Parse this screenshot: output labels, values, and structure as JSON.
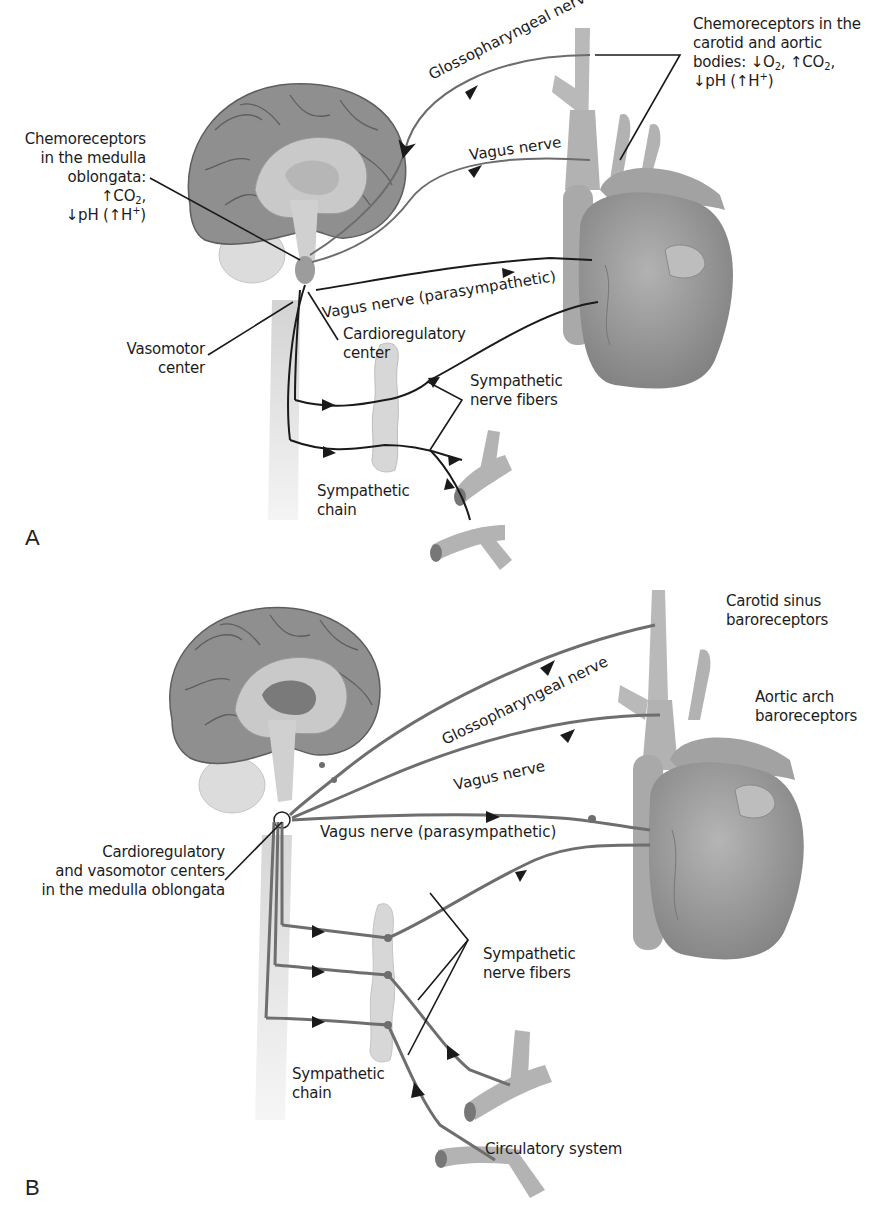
{
  "panelA": {
    "letter": "A",
    "labels": {
      "medulla_chemo_line1": "Chemoreceptors",
      "medulla_chemo_line2": "in the medulla",
      "medulla_chemo_line3": "oblongata:",
      "medulla_chemo_co2": "↑CO",
      "medulla_chemo_co2_sub": "2",
      "medulla_chemo_co2_tail": ",",
      "medulla_chemo_ph": "↓pH (↑H",
      "medulla_chemo_ph_sup": "+",
      "medulla_chemo_ph_tail": ")",
      "carotid_line1": "Chemoreceptors in the",
      "carotid_line2": "carotid and aortic",
      "carotid_line3a": "bodies: ↓O",
      "carotid_line3_sub1": "2",
      "carotid_line3b": ", ↑CO",
      "carotid_line3_sub2": "2",
      "carotid_line3c": ",",
      "carotid_line4a": "↓pH (↑H",
      "carotid_line4_sup": "+",
      "carotid_line4b": ")",
      "glossopharyngeal": "Glossopharyngeal nerve",
      "vagus": "Vagus nerve",
      "vagus_para": "Vagus nerve (parasympathetic)",
      "cardio_line1": "Cardioregulatory",
      "cardio_line2": "center",
      "vasomotor_line1": "Vasomotor",
      "vasomotor_line2": "center",
      "symp_fibers_line1": "Sympathetic",
      "symp_fibers_line2": "nerve fibers",
      "symp_chain_line1": "Sympathetic",
      "symp_chain_line2": "chain"
    },
    "nerve_color": "#222222"
  },
  "panelB": {
    "letter": "B",
    "labels": {
      "carotid_line1": "Carotid sinus",
      "carotid_line2": "baroreceptors",
      "aortic_line1": "Aortic arch",
      "aortic_line2": "baroreceptors",
      "glossopharyngeal": "Glossopharyngeal nerve",
      "vagus": "Vagus nerve",
      "vagus_para": "Vagus nerve (parasympathetic)",
      "centers_line1": "Cardioregulatory",
      "centers_line2": "and vasomotor centers",
      "centers_line3": "in the medulla oblongata",
      "symp_fibers_line1": "Sympathetic",
      "symp_fibers_line2": "nerve fibers",
      "symp_chain_line1": "Sympathetic",
      "symp_chain_line2": "chain",
      "circulatory": "Circulatory system"
    },
    "nerve_color": "#6e6e6e"
  },
  "colors": {
    "cortex": "#8f8f8f",
    "cortex_dark": "#5e5e5e",
    "inner_brain": "#c9c9c9",
    "brainstem": "#d4d4d4",
    "cerebellum": "#dcdcdc",
    "heart": "#9a9a9a",
    "vessel": "#b3b3b3",
    "chain": "#d9d9d9"
  }
}
